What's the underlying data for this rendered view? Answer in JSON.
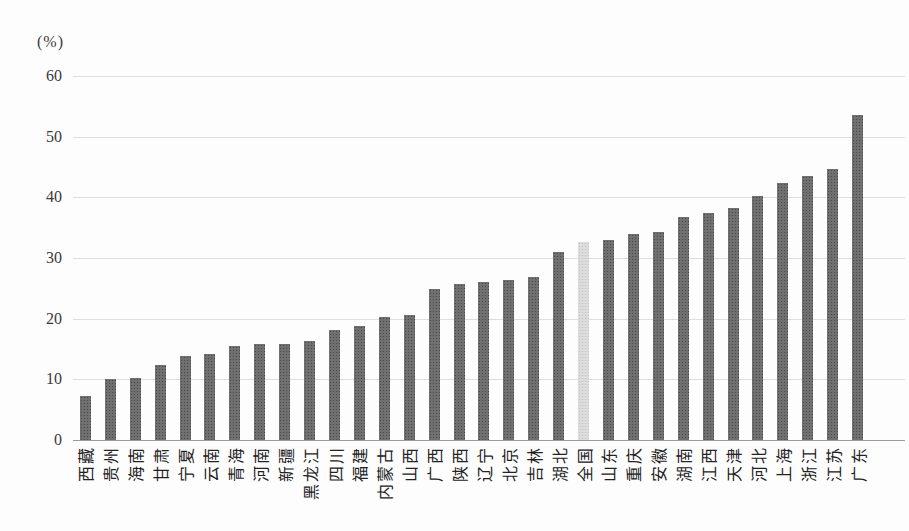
{
  "chart_data": {
    "type": "bar",
    "title": "",
    "unit_label": "(%)",
    "ylim": [
      0,
      60
    ],
    "yticks": [
      0,
      10,
      20,
      30,
      40,
      50,
      60
    ],
    "grid": true,
    "legend": "none",
    "bar_color": "#707070",
    "highlight_color": "#dcdcdc",
    "highlight_category": "全国",
    "categories": [
      "西藏",
      "贵州",
      "海南",
      "甘肃",
      "宁夏",
      "云南",
      "青海",
      "河南",
      "新疆",
      "黑龙江",
      "四川",
      "福建",
      "内蒙古",
      "山西",
      "广西",
      "陕西",
      "辽宁",
      "北京",
      "吉林",
      "湖北",
      "全国",
      "山东",
      "重庆",
      "安徽",
      "湖南",
      "江西",
      "天津",
      "河北",
      "上海",
      "浙江",
      "江苏",
      "广东"
    ],
    "values": [
      7.2,
      10.0,
      10.3,
      12.3,
      13.9,
      14.1,
      15.5,
      15.8,
      15.9,
      16.4,
      18.1,
      18.8,
      20.2,
      20.6,
      24.9,
      25.7,
      26.0,
      26.3,
      26.8,
      31.0,
      32.6,
      33.0,
      34.0,
      34.3,
      36.8,
      37.4,
      38.2,
      40.2,
      42.3,
      43.6,
      44.6,
      53.6
    ]
  }
}
